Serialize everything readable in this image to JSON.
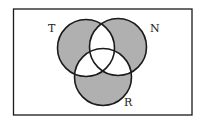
{
  "diagram": {
    "type": "venn",
    "sets": [
      {
        "id": "T",
        "label": "T"
      },
      {
        "id": "N",
        "label": "N"
      },
      {
        "id": "R",
        "label": "R"
      }
    ],
    "shaded_regions": [
      "T only",
      "N only",
      "R only"
    ],
    "unshaded_regions": [
      "T∩N only",
      "T∩R only",
      "N∩R only",
      "T∩N∩R",
      "outside"
    ],
    "colors": {
      "shade": "#b0b0b0",
      "stroke": "#1a1a1a",
      "background": "#ffffff"
    }
  }
}
